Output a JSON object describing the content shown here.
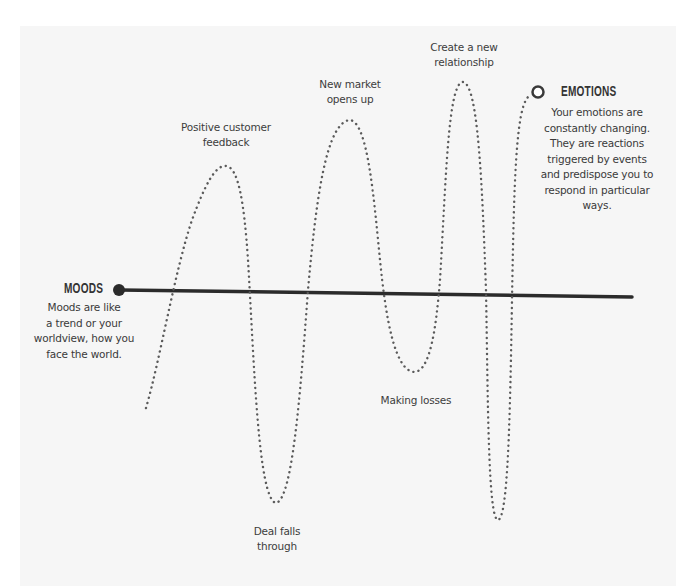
{
  "diagram": {
    "background": "#f6f6f6",
    "line_color": "#2b2b2b",
    "dot_color": "#555555",
    "moods": {
      "title": "MOODS",
      "description": [
        "Moods are like",
        "a trend or your",
        "worldview, how you",
        "face the world."
      ]
    },
    "emotions": {
      "title": "EMOTIONS",
      "description": [
        "Your emotions are",
        "constantly changing.",
        "They are reactions",
        "triggered by events",
        "and predispose you to",
        "respond in particular",
        "ways."
      ]
    },
    "events": [
      {
        "id": "peak1",
        "type": "peak",
        "lines": [
          "Positive customer",
          "feedback"
        ]
      },
      {
        "id": "trough1",
        "type": "trough",
        "lines": [
          "Deal falls",
          "through"
        ]
      },
      {
        "id": "peak2",
        "type": "peak",
        "lines": [
          "New market",
          "opens up"
        ]
      },
      {
        "id": "trough2",
        "type": "trough",
        "lines": [
          "Making losses"
        ]
      },
      {
        "id": "peak3",
        "type": "peak",
        "lines": [
          "Create a new",
          "relationship"
        ]
      }
    ]
  }
}
